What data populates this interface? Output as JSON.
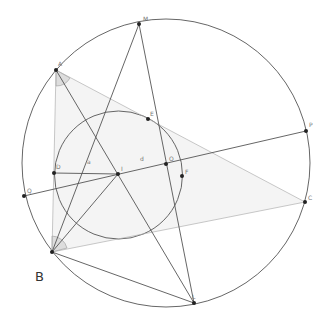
{
  "figure": {
    "caption_label": "B",
    "colors": {
      "dark_line": "#555555",
      "light_line": "#b0b0b0",
      "point": "#222222",
      "triangle_fill": "#f4f4f4",
      "angle_fill": "#dddddd",
      "label": "#777777"
    },
    "points": [
      {
        "id": "A",
        "label": "A"
      },
      {
        "id": "B",
        "label": ""
      },
      {
        "id": "C",
        "label": "C"
      },
      {
        "id": "M",
        "label": "M"
      },
      {
        "id": "P",
        "label": "P"
      },
      {
        "id": "L",
        "label": "L"
      },
      {
        "id": "Q",
        "label": "Q"
      },
      {
        "id": "I",
        "label": "I"
      },
      {
        "id": "D",
        "label": "D"
      },
      {
        "id": "O",
        "label": "O"
      },
      {
        "id": "E",
        "label": "E"
      },
      {
        "id": "F",
        "label": "F"
      }
    ],
    "segment_labels": [
      {
        "id": "a",
        "label": "a"
      },
      {
        "id": "d",
        "label": "d"
      }
    ],
    "circles": [
      {
        "id": "circumcircle",
        "through": [
          "A",
          "M",
          "P",
          "C",
          "L",
          "B",
          "Q"
        ]
      },
      {
        "id": "incircle",
        "center": "I",
        "through": [
          "D",
          "E",
          "F"
        ]
      }
    ],
    "segments": [
      {
        "from": "A",
        "to": "B",
        "style": "light"
      },
      {
        "from": "A",
        "to": "C",
        "style": "light"
      },
      {
        "from": "B",
        "to": "C",
        "style": "light"
      },
      {
        "from": "A",
        "to": "L",
        "style": "dark"
      },
      {
        "from": "B",
        "to": "M",
        "style": "dark"
      },
      {
        "from": "B",
        "to": "I",
        "style": "dark"
      },
      {
        "from": "B",
        "to": "L",
        "style": "dark"
      },
      {
        "from": "M",
        "to": "L",
        "style": "dark"
      },
      {
        "from": "Q",
        "to": "P",
        "style": "dark"
      },
      {
        "from": "D",
        "to": "I",
        "style": "dark"
      }
    ],
    "angle_marks": [
      "A",
      "B"
    ]
  }
}
